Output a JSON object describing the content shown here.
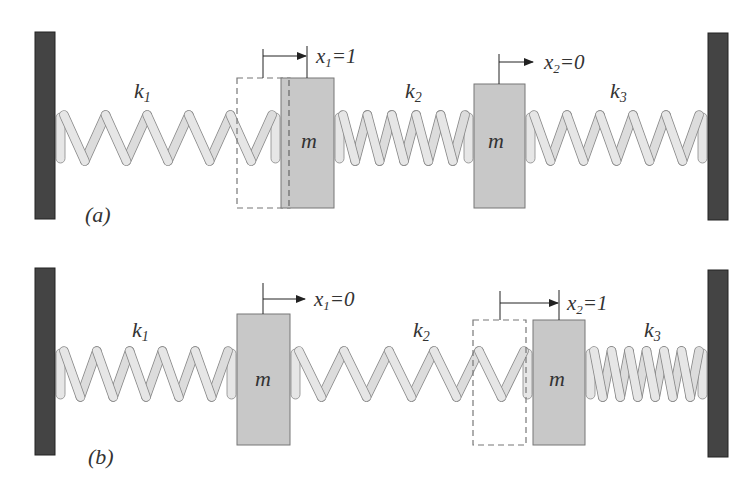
{
  "figure": {
    "colors": {
      "wall": "#444444",
      "wall_border": "#222222",
      "mass_fill": "#c8c8c8",
      "mass_border": "#777777",
      "spring_fill": "#e6e6e6",
      "spring_border": "#888888",
      "ghost_dash": "#777777",
      "arrow": "#222222",
      "text": "#333333"
    },
    "panels": [
      {
        "id": "a",
        "caption": "(a)",
        "springs": [
          {
            "label": "k",
            "sub": "1"
          },
          {
            "label": "k",
            "sub": "2"
          },
          {
            "label": "k",
            "sub": "3"
          }
        ],
        "masses": [
          {
            "label": "m",
            "displacement_var": "x",
            "displacement_sub": "1",
            "displacement_value": "=1",
            "displaced": true
          },
          {
            "label": "m",
            "displacement_var": "x",
            "displacement_sub": "2",
            "displacement_value": "=0",
            "displaced": false
          }
        ]
      },
      {
        "id": "b",
        "caption": "(b)",
        "springs": [
          {
            "label": "k",
            "sub": "1"
          },
          {
            "label": "k",
            "sub": "2"
          },
          {
            "label": "k",
            "sub": "3"
          }
        ],
        "masses": [
          {
            "label": "m",
            "displacement_var": "x",
            "displacement_sub": "1",
            "displacement_value": "=0",
            "displaced": false
          },
          {
            "label": "m",
            "displacement_var": "x",
            "displacement_sub": "2",
            "displacement_value": "=1",
            "displaced": true
          }
        ]
      }
    ]
  }
}
